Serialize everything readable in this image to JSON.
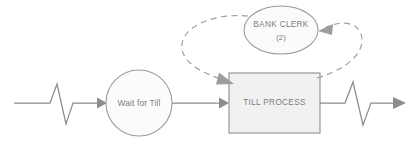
{
  "diagram": {
    "canvas": {
      "width": 420,
      "height": 146,
      "background": "#ffffff"
    },
    "colors": {
      "node_stroke": "#9a9a9a",
      "node_fill": "#fbfbfb",
      "box_stroke": "#8f8f8f",
      "box_fill": "#f1f1f1",
      "flow_stroke": "#8c8c8c",
      "dashed_stroke": "#9d9d9d",
      "label_text": "#7c7c7c"
    },
    "nodes": [
      {
        "id": "resource-bank-clerk",
        "shape": "ellipse",
        "name": "BANK CLERK",
        "count": "(2)",
        "cx": 281,
        "cy": 30,
        "rx": 37,
        "ry": 24
      },
      {
        "id": "queue-wait-for-till",
        "shape": "circle",
        "name": "Wait for Till",
        "cx": 139,
        "cy": 103,
        "r": 33
      },
      {
        "id": "activity-till-process",
        "shape": "rectangle",
        "name": "TILL PROCESS",
        "x": 229,
        "y": 73,
        "width": 91,
        "height": 60
      }
    ],
    "connectors": [
      {
        "id": "entry-flow",
        "type": "solid-arrow",
        "from": "source-break-left",
        "to": "queue-wait-for-till",
        "has_break_symbol": true
      },
      {
        "id": "queue-to-process",
        "type": "solid-arrow",
        "from": "queue-wait-for-till",
        "to": "activity-till-process",
        "has_break_symbol": false
      },
      {
        "id": "exit-flow",
        "type": "solid-arrow",
        "from": "activity-till-process",
        "to": "sink-break-right",
        "has_break_symbol": true
      },
      {
        "id": "clerk-seizes-process",
        "type": "dashed-arrow",
        "from": "resource-bank-clerk",
        "to": "activity-till-process",
        "side": "left"
      },
      {
        "id": "process-releases-clerk",
        "type": "dashed-arrow",
        "from": "activity-till-process",
        "to": "resource-bank-clerk",
        "side": "right"
      }
    ],
    "icons": {
      "break_left": "zigzag-break-icon",
      "break_right": "zigzag-break-icon",
      "arrow_entry": "arrowhead-icon",
      "arrow_queue_out": "arrowhead-icon",
      "arrow_exit": "arrowhead-icon",
      "arrow_seize": "arrowhead-icon",
      "arrow_release": "arrowhead-icon"
    }
  }
}
